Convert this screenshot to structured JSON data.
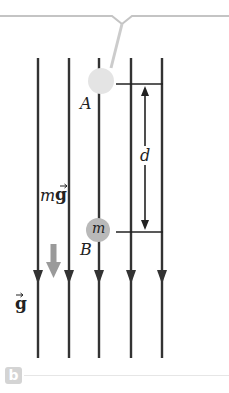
{
  "figure": {
    "panel_label": "b",
    "labels": {
      "point_a": "A",
      "point_b": "B",
      "distance": "d",
      "mass": "m",
      "force_m": "m",
      "force_g": "g",
      "field_g": "g"
    },
    "field_lines": {
      "count": 5,
      "direction": "down",
      "color": "#333333"
    },
    "colors": {
      "ball_a": "#e2e2e2",
      "ball_b": "#b8b8b8",
      "force_arrow": "#999999",
      "string": "#cccccc",
      "bracket": "#c4c4c4"
    }
  }
}
